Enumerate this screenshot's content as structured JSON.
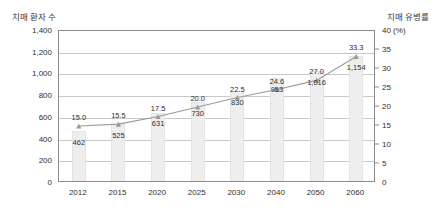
{
  "chart_data": {
    "type": "bar",
    "title": "",
    "left_axis_title": "치매 환자 수",
    "right_axis_title": "치매 유병률",
    "right_axis_unit": "(%)",
    "categories": [
      "2012",
      "2015",
      "2020",
      "2025",
      "2030",
      "2040",
      "2050",
      "2060"
    ],
    "xlabel": "",
    "ylabel": "치매 환자 수",
    "y2label": "치매 유병률",
    "ylim": [
      0,
      1400
    ],
    "y2lim": [
      0,
      40
    ],
    "yticks": [
      "0",
      "200",
      "400",
      "600",
      "800",
      "1,000",
      "1,200",
      "1,400"
    ],
    "ytick_values": [
      0,
      200,
      400,
      600,
      800,
      1000,
      1200,
      1400
    ],
    "y2ticks": [
      "0",
      "5",
      "10",
      "15",
      "20",
      "25",
      "30",
      "35",
      "40"
    ],
    "y2tick_values": [
      0,
      5,
      10,
      15,
      20,
      25,
      30,
      35,
      40
    ],
    "grid": true,
    "legend": "none",
    "series": [
      {
        "name": "치매 환자 수",
        "type": "bar",
        "axis": "left",
        "values": [
          462,
          525,
          631,
          730,
          830,
          953,
          1016,
          1154
        ],
        "labels": [
          "462",
          "525",
          "631",
          "730",
          "830",
          "953",
          "1,016",
          "1,154"
        ],
        "color": "#eeeeee"
      },
      {
        "name": "치매 유병률",
        "type": "line",
        "axis": "right",
        "values": [
          15.0,
          15.5,
          17.5,
          20.0,
          22.5,
          24.6,
          27.0,
          33.3
        ],
        "labels": [
          "15.0",
          "15.5",
          "17.5",
          "20.0",
          "22.5",
          "24.6",
          "27.0",
          "33.3"
        ],
        "color": "#9a9a9a"
      }
    ]
  }
}
